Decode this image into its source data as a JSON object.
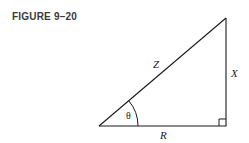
{
  "figure": {
    "caption": "FIGURE 9–20"
  },
  "diagram": {
    "type": "right-triangle",
    "labels": {
      "hypotenuse": "Z",
      "opposite": "X",
      "adjacent": "R",
      "angle": "θ"
    },
    "vertices": {
      "angle_vertex": [
        99,
        126
      ],
      "top_vertex": [
        226,
        18
      ],
      "right_angle_vertex": [
        226,
        126
      ]
    },
    "right_angle_marker": true,
    "line_color": "#1a1a1a"
  }
}
